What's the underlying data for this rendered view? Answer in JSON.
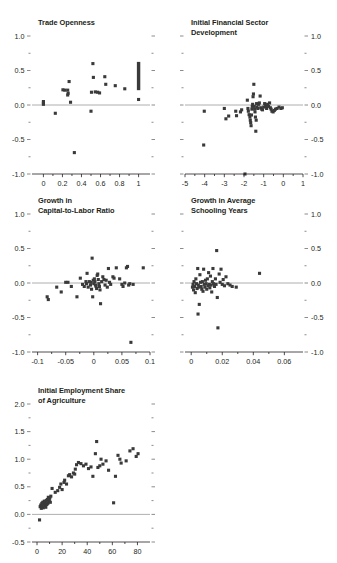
{
  "figure": {
    "name": "five-panel-scatter-figure",
    "background": "#ffffff",
    "point_color": "#3a3a3a",
    "axis_color": "#231f20",
    "zero_line_color": "#9b9b9b"
  },
  "chart_data": [
    {
      "id": "panel-trade-openness",
      "type": "scatter",
      "title": "Trade Openness",
      "xlabel": "",
      "ylabel": "",
      "xlim": [
        -0.12,
        1.12
      ],
      "ylim": [
        -1.0,
        1.0
      ],
      "xticks": [
        0,
        0.2,
        0.4,
        0.6,
        0.8,
        1
      ],
      "xtick_labels": [
        "0",
        "0.2",
        "0.4",
        "0.6",
        "0.8",
        "1"
      ],
      "yticks": [
        -1.0,
        -0.5,
        0.0,
        0.5,
        1.0
      ],
      "ytick_labels": [
        "-1.0",
        "-0.5",
        "0.0",
        "0.5",
        "1.0"
      ],
      "yticks_minor": [
        -0.75,
        -0.25,
        0.25,
        0.75
      ],
      "y_axis_side": "left",
      "grid": false,
      "legend": null,
      "zero_line": 0.0,
      "points": [
        [
          0.0,
          0.03
        ],
        [
          0.0,
          0.05
        ],
        [
          0.0,
          0.01
        ],
        [
          0.125,
          -0.12
        ],
        [
          0.205,
          0.22
        ],
        [
          0.225,
          0.215
        ],
        [
          0.27,
          0.34
        ],
        [
          0.255,
          0.215
        ],
        [
          0.26,
          0.17
        ],
        [
          0.255,
          0.145
        ],
        [
          0.285,
          0.04
        ],
        [
          0.325,
          -0.69
        ],
        [
          0.5,
          -0.09
        ],
        [
          0.505,
          0.185
        ],
        [
          0.525,
          0.4
        ],
        [
          0.52,
          0.6
        ],
        [
          0.545,
          0.19
        ],
        [
          0.57,
          0.185
        ],
        [
          0.59,
          0.175
        ],
        [
          0.645,
          0.41
        ],
        [
          0.655,
          0.3
        ],
        [
          0.755,
          0.28
        ],
        [
          0.855,
          0.235
        ],
        [
          1.0,
          0.08
        ]
      ],
      "bars": [
        {
          "x": 1.0,
          "y_low": 0.215,
          "y_high": 0.625,
          "width": 0.035
        }
      ]
    },
    {
      "id": "panel-initial-financial-sector-development",
      "type": "scatter",
      "title": "Initial Financial Sector\nDevelopment",
      "title_line1": "Initial Financial Sector",
      "title_line2": "Development",
      "xlabel": "",
      "ylabel": "",
      "xlim": [
        -5.0,
        1.0
      ],
      "ylim": [
        -1.0,
        1.0
      ],
      "xticks": [
        -5,
        -4,
        -3,
        -2,
        -1,
        0,
        1
      ],
      "xtick_labels": [
        "-5",
        "-4",
        "-3",
        "-2",
        "-1",
        "0",
        "1"
      ],
      "yticks": [
        -1.0,
        -0.5,
        0.0,
        0.5,
        1.0
      ],
      "ytick_labels": [
        "-1.0",
        "-0.5",
        "0.0",
        "0.5",
        "1.0"
      ],
      "yticks_minor": [
        -0.75,
        -0.25,
        0.25,
        0.75
      ],
      "y_axis_side": "right",
      "grid": false,
      "legend": null,
      "zero_line": 0.0,
      "points": [
        [
          -4.05,
          -0.58
        ],
        [
          -4.02,
          -0.09
        ],
        [
          -3.0,
          -0.05
        ],
        [
          -2.92,
          -0.2
        ],
        [
          -2.78,
          -0.16
        ],
        [
          -2.42,
          -0.09
        ],
        [
          -2.38,
          -0.155
        ],
        [
          -2.18,
          -0.1
        ],
        [
          -2.12,
          -0.07
        ],
        [
          -1.95,
          -1.0
        ],
        [
          -1.83,
          0.07
        ],
        [
          -1.8,
          -0.05
        ],
        [
          -1.78,
          -0.09
        ],
        [
          -1.74,
          -0.14
        ],
        [
          -1.7,
          -0.175
        ],
        [
          -1.68,
          -0.22
        ],
        [
          -1.66,
          -0.255
        ],
        [
          -1.64,
          -0.3
        ],
        [
          -1.62,
          -0.145
        ],
        [
          -1.6,
          -0.06
        ],
        [
          -1.58,
          -0.02
        ],
        [
          -1.56,
          0.01
        ],
        [
          -1.54,
          0.12
        ],
        [
          -1.52,
          0.16
        ],
        [
          -1.5,
          0.3
        ],
        [
          -1.48,
          -0.02
        ],
        [
          -1.46,
          -0.06
        ],
        [
          -1.44,
          -0.1
        ],
        [
          -1.42,
          -0.175
        ],
        [
          -1.4,
          -0.38
        ],
        [
          -1.38,
          -0.22
        ],
        [
          -1.36,
          0.02
        ],
        [
          -1.34,
          -0.03
        ],
        [
          -1.3,
          -0.05
        ],
        [
          -1.26,
          0.01
        ],
        [
          -1.22,
          0.03
        ],
        [
          -1.18,
          0.13
        ],
        [
          -1.15,
          -0.04
        ],
        [
          -1.1,
          -0.06
        ],
        [
          -1.06,
          -0.07
        ],
        [
          -1.0,
          -0.03
        ],
        [
          -0.95,
          0.02
        ],
        [
          -0.9,
          -0.02
        ],
        [
          -0.85,
          -0.05
        ],
        [
          -0.8,
          0.01
        ],
        [
          -0.75,
          -0.02
        ],
        [
          -0.7,
          0.03
        ],
        [
          -0.66,
          -0.04
        ],
        [
          -0.62,
          -0.06
        ],
        [
          -0.58,
          -0.09
        ],
        [
          -0.52,
          -0.1
        ],
        [
          -0.46,
          -0.08
        ],
        [
          -0.4,
          -0.06
        ],
        [
          -0.32,
          -0.05
        ],
        [
          -0.22,
          -0.03
        ],
        [
          -0.12,
          -0.05
        ],
        [
          -0.05,
          -0.04
        ]
      ],
      "bars": []
    },
    {
      "id": "panel-growth-capital-to-labor-ratio",
      "type": "scatter",
      "title": "Growth in\nCapital-to-Labor Ratio",
      "title_line1": "Growth in",
      "title_line2": "Capital-to-Labor Ratio",
      "xlabel": "",
      "ylabel": "",
      "xlim": [
        -0.11,
        0.1
      ],
      "ylim": [
        -1.0,
        1.0
      ],
      "xticks": [
        -0.1,
        -0.05,
        0,
        0.05,
        0.1
      ],
      "xtick_labels": [
        "-0.1",
        "-0.05",
        "0",
        "0.05",
        "0.1"
      ],
      "yticks": [
        -1.0,
        -0.5,
        0.0,
        0.5,
        1.0
      ],
      "ytick_labels": [
        "-1.0",
        "-0.5",
        "0.0",
        "0.5",
        "1.0"
      ],
      "yticks_minor": [
        -0.75,
        -0.25,
        0.25,
        0.75
      ],
      "y_axis_side": "left",
      "grid": false,
      "legend": null,
      "zero_line": 0.0,
      "points": [
        [
          -0.083,
          -0.2
        ],
        [
          -0.081,
          -0.24
        ],
        [
          -0.066,
          -0.06
        ],
        [
          -0.058,
          -0.13
        ],
        [
          -0.05,
          0.01
        ],
        [
          -0.046,
          0.01
        ],
        [
          -0.04,
          -0.05
        ],
        [
          -0.03,
          -0.2
        ],
        [
          -0.024,
          0.07
        ],
        [
          -0.02,
          -0.02
        ],
        [
          -0.017,
          -0.05
        ],
        [
          -0.014,
          0.02
        ],
        [
          -0.013,
          -0.01
        ],
        [
          -0.012,
          0.14
        ],
        [
          -0.01,
          -0.06
        ],
        [
          -0.008,
          0.02
        ],
        [
          -0.006,
          -0.03
        ],
        [
          -0.005,
          0.01
        ],
        [
          -0.004,
          -0.09
        ],
        [
          -0.003,
          0.36
        ],
        [
          -0.002,
          -0.2
        ],
        [
          -0.001,
          0.04
        ],
        [
          0.0,
          -0.01
        ],
        [
          0.001,
          0.06
        ],
        [
          0.002,
          0.02
        ],
        [
          0.003,
          -0.03
        ],
        [
          0.004,
          -0.05
        ],
        [
          0.005,
          -0.08
        ],
        [
          0.006,
          0.11
        ],
        [
          0.007,
          0.13
        ],
        [
          0.008,
          0.05
        ],
        [
          0.009,
          -0.01
        ],
        [
          0.01,
          -0.05
        ],
        [
          0.011,
          -0.1
        ],
        [
          0.012,
          -0.3
        ],
        [
          0.014,
          0.02
        ],
        [
          0.016,
          0.09
        ],
        [
          0.018,
          0.05
        ],
        [
          0.02,
          -0.03
        ],
        [
          0.022,
          0.04
        ],
        [
          0.024,
          -0.06
        ],
        [
          0.026,
          0.21
        ],
        [
          0.028,
          0.01
        ],
        [
          0.03,
          -0.02
        ],
        [
          0.034,
          0.09
        ],
        [
          0.036,
          0.07
        ],
        [
          0.04,
          0.22
        ],
        [
          0.046,
          0.06
        ],
        [
          0.05,
          -0.02
        ],
        [
          0.052,
          -0.05
        ],
        [
          0.055,
          0.0
        ],
        [
          0.058,
          0.22
        ],
        [
          0.06,
          0.24
        ],
        [
          0.062,
          -0.03
        ],
        [
          0.064,
          -0.01
        ],
        [
          0.066,
          -0.86
        ],
        [
          0.07,
          -0.02
        ],
        [
          0.088,
          0.22
        ]
      ],
      "bars": []
    },
    {
      "id": "panel-growth-average-schooling-years",
      "type": "scatter",
      "title": "Growth in Average\nSchooling Years",
      "title_line1": "Growth in Average",
      "title_line2": "Schooling Years",
      "xlabel": "",
      "ylabel": "",
      "xlim": [
        -0.004,
        0.072
      ],
      "ylim": [
        -1.0,
        1.0
      ],
      "xticks": [
        0,
        0.02,
        0.04,
        0.06
      ],
      "xtick_labels": [
        "0",
        "0.02",
        "0.04",
        "0.06"
      ],
      "yticks": [
        -1.0,
        -0.5,
        0.0,
        0.5,
        1.0
      ],
      "ytick_labels": [
        "-1.0",
        "-0.5",
        "0.0",
        "0.5",
        "1.0"
      ],
      "yticks_minor": [
        -0.75,
        -0.25,
        0.25,
        0.75
      ],
      "y_axis_side": "right",
      "grid": false,
      "legend": null,
      "zero_line": 0.0,
      "points": [
        [
          0.0008,
          -0.06
        ],
        [
          0.0012,
          -0.02
        ],
        [
          0.0015,
          -0.1
        ],
        [
          0.0018,
          0.02
        ],
        [
          0.0022,
          -0.05
        ],
        [
          0.0026,
          -0.14
        ],
        [
          0.003,
          0.06
        ],
        [
          0.0034,
          -0.01
        ],
        [
          0.0038,
          -0.08
        ],
        [
          0.0042,
          0.21
        ],
        [
          0.0046,
          -0.03
        ],
        [
          0.005,
          -0.06
        ],
        [
          0.0052,
          -0.31
        ],
        [
          0.0056,
          0.12
        ],
        [
          0.006,
          0.01
        ],
        [
          0.0064,
          -0.05
        ],
        [
          0.0068,
          -0.09
        ],
        [
          0.0072,
          0.02
        ],
        [
          0.0076,
          -0.12
        ],
        [
          0.008,
          0.2
        ],
        [
          0.0084,
          -0.02
        ],
        [
          0.0088,
          -0.06
        ],
        [
          0.0092,
          0.04
        ],
        [
          0.0096,
          -0.01
        ],
        [
          0.01,
          -0.09
        ],
        [
          0.0104,
          0.06
        ],
        [
          0.0108,
          -0.04
        ],
        [
          0.0112,
          0.15
        ],
        [
          0.0116,
          -0.02
        ],
        [
          0.012,
          -0.07
        ],
        [
          0.0124,
          0.1
        ],
        [
          0.0128,
          -0.03
        ],
        [
          0.0132,
          -0.13
        ],
        [
          0.0136,
          0.02
        ],
        [
          0.014,
          0.21
        ],
        [
          0.0144,
          -0.01
        ],
        [
          0.015,
          -0.05
        ],
        [
          0.0156,
          0.06
        ],
        [
          0.016,
          -0.02
        ],
        [
          0.0164,
          0.47
        ],
        [
          0.0168,
          -0.21
        ],
        [
          0.0172,
          -0.65
        ],
        [
          0.018,
          0.13
        ],
        [
          0.0186,
          0.01
        ],
        [
          0.0192,
          0.2
        ],
        [
          0.02,
          -0.02
        ],
        [
          0.0206,
          0.05
        ],
        [
          0.0214,
          -0.04
        ],
        [
          0.0224,
          0.09
        ],
        [
          0.0236,
          -0.01
        ],
        [
          0.025,
          -0.03
        ],
        [
          0.0264,
          -0.05
        ],
        [
          0.029,
          -0.06
        ],
        [
          0.044,
          0.14
        ],
        [
          0.0044,
          -0.45
        ]
      ],
      "bars": []
    },
    {
      "id": "panel-initial-employment-share-agriculture",
      "type": "scatter",
      "title": "Initial Employment Share\nof Agriculture",
      "title_line1": "Initial Employment Share",
      "title_line2": "of Agriculture",
      "xlabel": "",
      "ylabel": "",
      "xlim": [
        -4,
        90
      ],
      "ylim": [
        -0.5,
        2.0
      ],
      "xticks": [
        0,
        20,
        40,
        60,
        80
      ],
      "xtick_labels": [
        "0",
        "20",
        "40",
        "60",
        "80"
      ],
      "yticks": [
        -0.5,
        0.0,
        0.5,
        1.0,
        1.5,
        2.0
      ],
      "ytick_labels": [
        "-0.5",
        "0.0",
        "0.5",
        "1.0",
        "1.5",
        "2.0"
      ],
      "yticks_minor": [
        -0.25,
        0.25,
        0.75,
        1.25,
        1.75
      ],
      "y_axis_side": "left",
      "grid": false,
      "legend": null,
      "zero_line": 0.0,
      "points": [
        [
          2.0,
          -0.1
        ],
        [
          2.5,
          0.14
        ],
        [
          3.0,
          0.17
        ],
        [
          3.4,
          0.11
        ],
        [
          3.8,
          0.2
        ],
        [
          4.2,
          0.15
        ],
        [
          4.6,
          0.22
        ],
        [
          5.0,
          0.12
        ],
        [
          5.4,
          0.19
        ],
        [
          5.8,
          0.24
        ],
        [
          6.2,
          0.16
        ],
        [
          6.6,
          0.21
        ],
        [
          7.0,
          0.13
        ],
        [
          7.4,
          0.25
        ],
        [
          7.8,
          0.18
        ],
        [
          8.2,
          0.27
        ],
        [
          8.6,
          0.2
        ],
        [
          9.0,
          0.31
        ],
        [
          9.4,
          0.23
        ],
        [
          9.8,
          0.26
        ],
        [
          10.2,
          0.3
        ],
        [
          10.6,
          0.22
        ],
        [
          11.0,
          0.33
        ],
        [
          12.0,
          0.47
        ],
        [
          14.5,
          0.4
        ],
        [
          16.5,
          0.43
        ],
        [
          18.0,
          0.49
        ],
        [
          19.0,
          0.55
        ],
        [
          20.0,
          0.45
        ],
        [
          21.5,
          0.58
        ],
        [
          22.0,
          0.62
        ],
        [
          23.5,
          0.55
        ],
        [
          25.0,
          0.7
        ],
        [
          26.0,
          0.72
        ],
        [
          27.5,
          0.68
        ],
        [
          29.0,
          0.75
        ],
        [
          30.0,
          0.73
        ],
        [
          30.5,
          0.82
        ],
        [
          31.5,
          0.9
        ],
        [
          33.0,
          0.94
        ],
        [
          35.0,
          0.92
        ],
        [
          37.0,
          0.88
        ],
        [
          39.0,
          0.91
        ],
        [
          41.0,
          0.83
        ],
        [
          43.0,
          0.86
        ],
        [
          44.5,
          0.69
        ],
        [
          46.5,
          1.1
        ],
        [
          47.5,
          1.32
        ],
        [
          48.5,
          0.85
        ],
        [
          50.0,
          0.88
        ],
        [
          51.0,
          1.0
        ],
        [
          52.5,
          0.91
        ],
        [
          55.0,
          0.97
        ],
        [
          57.0,
          0.8
        ],
        [
          61.0,
          0.21
        ],
        [
          62.5,
          0.69
        ],
        [
          64.5,
          1.07
        ],
        [
          66.0,
          1.0
        ],
        [
          67.0,
          0.93
        ],
        [
          71.0,
          0.97
        ],
        [
          74.0,
          1.15
        ],
        [
          76.5,
          1.19
        ],
        [
          79.0,
          1.05
        ],
        [
          80.5,
          1.1
        ]
      ],
      "bars": []
    }
  ]
}
